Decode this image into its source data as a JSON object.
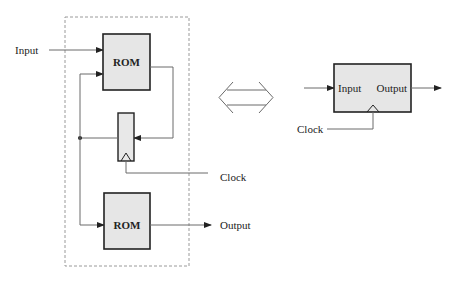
{
  "diagram": {
    "left": {
      "input_label": "Input",
      "rom_top_label": "ROM",
      "rom_bottom_label": "ROM",
      "clock_label": "Clock",
      "output_label": "Output",
      "register_label": ""
    },
    "equivalence_symbol": "double-arrow",
    "right": {
      "block_input_label": "Input",
      "block_output_label": "Output",
      "clock_label": "Clock"
    },
    "colors": {
      "block_fill": "#e6e6e6",
      "block_stroke": "#222222",
      "wire": "#6a6a6a",
      "dashed_boundary": "#9a9a9a"
    }
  }
}
